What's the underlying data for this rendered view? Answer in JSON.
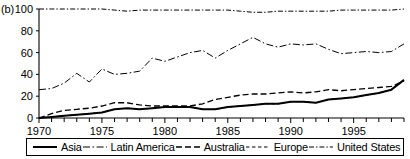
{
  "panel": {
    "label": "(b)"
  },
  "chart_data": {
    "type": "line",
    "title": "",
    "xlabel": "",
    "ylabel": "",
    "xlim": [
      1970,
      1999
    ],
    "ylim": [
      0,
      100
    ],
    "yticks": [
      0,
      20,
      40,
      60,
      80,
      100
    ],
    "xticks_major": [
      1970,
      1975,
      1980,
      1985,
      1990,
      1995
    ],
    "xticks_minor_step": 1,
    "grid": false,
    "legend_position": "bottom",
    "x": [
      1970,
      1971,
      1972,
      1973,
      1974,
      1975,
      1976,
      1977,
      1978,
      1979,
      1980,
      1981,
      1982,
      1983,
      1984,
      1985,
      1986,
      1987,
      1988,
      1989,
      1990,
      1991,
      1992,
      1993,
      1994,
      1995,
      1996,
      1997,
      1998,
      1999
    ],
    "series": [
      {
        "name": "Asia",
        "style": "solid",
        "values": [
          0,
          1,
          2,
          3,
          4,
          5,
          8,
          9,
          8,
          9,
          10,
          10,
          10,
          8,
          8,
          10,
          11,
          12,
          13,
          13,
          15,
          15,
          14,
          17,
          18,
          19,
          21,
          23,
          26,
          35
        ]
      },
      {
        "name": "Latin America",
        "style": "dash-dot",
        "values": [
          26,
          27,
          32,
          41,
          33,
          45,
          40,
          41,
          43,
          55,
          52,
          56,
          60,
          62,
          55,
          62,
          68,
          74,
          68,
          65,
          68,
          67,
          68,
          63,
          59,
          60,
          61,
          60,
          61,
          68
        ]
      },
      {
        "name": "Australia",
        "style": "long-dash",
        "values": [
          0,
          4,
          7,
          8,
          9,
          11,
          14,
          14,
          12,
          11,
          11,
          11,
          11,
          13,
          17,
          19,
          21,
          22,
          22,
          23,
          24,
          23,
          24,
          26,
          25,
          26,
          27,
          28,
          29,
          34
        ]
      },
      {
        "name": "Europe",
        "style": "short-dash",
        "values": [
          0,
          1,
          2,
          3,
          4,
          5,
          8,
          9,
          8,
          9,
          10,
          10,
          10,
          8,
          8,
          10,
          11,
          12,
          13,
          13,
          15,
          15,
          14,
          17,
          18,
          19,
          21,
          23,
          26,
          35
        ]
      },
      {
        "name": "United States",
        "style": "dash-dot-short",
        "values": [
          100,
          100,
          100,
          100,
          100,
          100,
          99,
          98,
          99,
          99,
          99,
          99,
          99,
          99,
          99,
          99,
          98,
          97,
          97,
          98,
          98,
          98,
          98,
          98,
          99,
          99,
          99,
          99,
          99,
          100
        ]
      }
    ]
  },
  "legend": {
    "entries": [
      {
        "label": "Asia",
        "swatch": "solid-line-icon"
      },
      {
        "label": "Latin America",
        "swatch": "dash-dot-line-icon"
      },
      {
        "label": "Australia",
        "swatch": "long-dash-line-icon"
      },
      {
        "label": "Europe",
        "swatch": "short-dash-line-icon"
      },
      {
        "label": "United States",
        "swatch": "dash-dot-short-line-icon"
      }
    ]
  }
}
